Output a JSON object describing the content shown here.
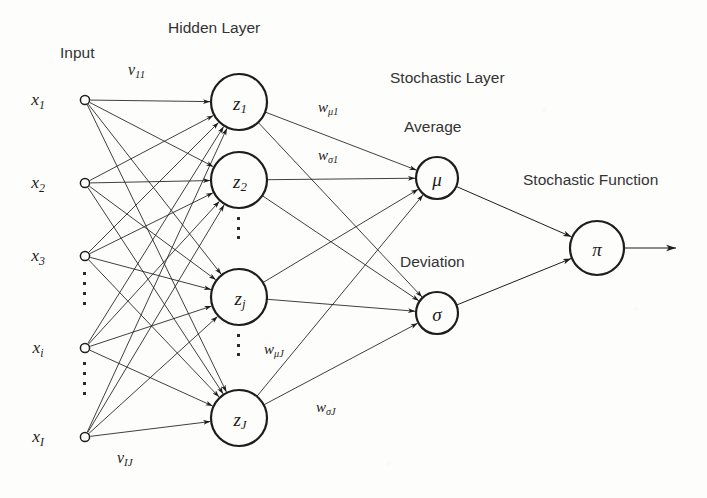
{
  "diagram": {
    "background_color": "#fdfdfc",
    "stroke_color": "#1d1d1d"
  },
  "headings": {
    "input": "Input",
    "hidden_layer": "Hidden Layer",
    "stochastic_layer": "Stochastic Layer",
    "average": "Average",
    "deviation": "Deviation",
    "stochastic_function": "Stochastic Function"
  },
  "input_layer": {
    "nodes": [
      {
        "base": "x",
        "sub": "1",
        "cx": 85,
        "cy": 100
      },
      {
        "base": "x",
        "sub": "2",
        "cx": 85,
        "cy": 183
      },
      {
        "base": "x",
        "sub": "3",
        "cx": 85,
        "cy": 256
      },
      {
        "base": "x",
        "sub": "i",
        "cx": 85,
        "cy": 348
      },
      {
        "base": "x",
        "sub": "I",
        "cx": 85,
        "cy": 437
      }
    ],
    "ellipses": [
      {
        "x": 85,
        "y": 288,
        "count": 4
      },
      {
        "x": 85,
        "y": 378,
        "count": 4
      }
    ]
  },
  "hidden_layer": {
    "nodes": [
      {
        "base": "z",
        "sub": "1",
        "cx": 239,
        "cy": 102,
        "r": 28
      },
      {
        "base": "z",
        "sub": "2",
        "cx": 239,
        "cy": 180,
        "r": 28
      },
      {
        "base": "z",
        "sub": "j",
        "cx": 239,
        "cy": 297,
        "r": 28
      },
      {
        "base": "z",
        "sub": "J",
        "cx": 239,
        "cy": 418,
        "r": 28
      }
    ],
    "ellipses": [
      {
        "x": 239,
        "y": 228,
        "count": 3
      },
      {
        "x": 239,
        "y": 345,
        "count": 3
      }
    ]
  },
  "stochastic_layer": {
    "nodes": [
      {
        "symbol": "μ",
        "name": "mu",
        "cx": 437,
        "cy": 178,
        "r": 21
      },
      {
        "symbol": "σ",
        "name": "sigma",
        "cx": 437,
        "cy": 313,
        "r": 21
      }
    ]
  },
  "output_layer": {
    "nodes": [
      {
        "symbol": "π",
        "name": "pi",
        "cx": 597,
        "cy": 248,
        "r": 27
      }
    ],
    "arrow_end_x": 676
  },
  "weight_labels": [
    {
      "name": "v-11",
      "base": "v",
      "sub": "11",
      "x": 128,
      "y": 62
    },
    {
      "name": "v-IJ",
      "base": "v",
      "sub": "IJ",
      "x": 117,
      "y": 450
    },
    {
      "name": "w-mu-1",
      "base": "w",
      "sub": "μ1",
      "x": 318,
      "y": 100
    },
    {
      "name": "w-sigma-1",
      "base": "w",
      "sub": "σ1",
      "x": 318,
      "y": 148
    },
    {
      "name": "w-mu-J",
      "base": "w",
      "sub": "μJ",
      "x": 264,
      "y": 342
    },
    {
      "name": "w-sigma-J",
      "base": "w",
      "sub": "σJ",
      "x": 316,
      "y": 400
    }
  ],
  "heading_positions": {
    "input": {
      "x": 60,
      "y": 45
    },
    "hidden_layer": {
      "x": 168,
      "y": 20
    },
    "stochastic_layer": {
      "x": 390,
      "y": 70
    },
    "average": {
      "x": 404,
      "y": 119
    },
    "deviation": {
      "x": 400,
      "y": 254
    },
    "stochastic_function": {
      "x": 523,
      "y": 172
    }
  }
}
